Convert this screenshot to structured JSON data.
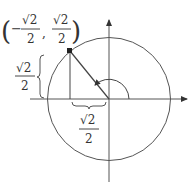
{
  "diagram": {
    "type": "unit-circle",
    "point_label": {
      "open": "(",
      "x_sign": "−",
      "x_num": "√2",
      "x_den": "2",
      "comma": ",",
      "y_num": "√2",
      "y_den": "2",
      "close": ")"
    },
    "vertical_leg_label": {
      "num": "√2",
      "den": "2"
    },
    "horizontal_leg_label": {
      "num": "√2",
      "den": "2"
    },
    "angle_degrees": 135,
    "colors": {
      "stroke": "#444444",
      "text": "#333333",
      "background": "#ffffff"
    }
  }
}
